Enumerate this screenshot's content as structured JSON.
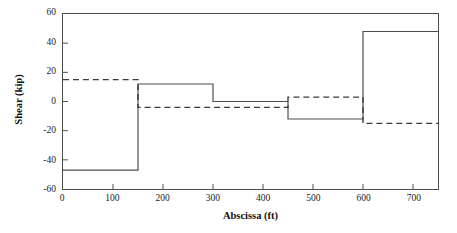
{
  "chart_data": {
    "type": "line",
    "title": "",
    "xlabel": "Abscissa (ft)",
    "ylabel": "Shear (kip)",
    "xlim": [
      0,
      750
    ],
    "ylim": [
      -60,
      60
    ],
    "xticks": [
      0,
      100,
      200,
      300,
      400,
      500,
      600,
      700
    ],
    "yticks": [
      -60,
      -40,
      -20,
      0,
      20,
      40,
      60
    ],
    "grid": false,
    "legend": "none",
    "series": [
      {
        "name": "solid-step",
        "style": "solid",
        "color": "#4d4d4d",
        "drawstyle": "steps-post",
        "x": [
          0,
          150,
          150,
          300,
          300,
          450,
          450,
          600,
          600,
          750
        ],
        "y": [
          -47,
          -47,
          12,
          12,
          0,
          0,
          -12,
          -12,
          48,
          48
        ],
        "segments": [
          {
            "x_start": 0,
            "x_end": 150,
            "value": -47
          },
          {
            "x_start": 150,
            "x_end": 300,
            "value": 12
          },
          {
            "x_start": 300,
            "x_end": 450,
            "value": 0
          },
          {
            "x_start": 450,
            "x_end": 600,
            "value": -12
          },
          {
            "x_start": 600,
            "x_end": 750,
            "value": 48
          }
        ]
      },
      {
        "name": "dashed-step",
        "style": "dashed",
        "color": "#3a3a3a",
        "drawstyle": "steps-post",
        "x": [
          0,
          150,
          150,
          450,
          450,
          600,
          600,
          750
        ],
        "y": [
          15,
          15,
          -4,
          -4,
          3,
          3,
          -15,
          -15
        ],
        "segments": [
          {
            "x_start": 0,
            "x_end": 150,
            "value": 15
          },
          {
            "x_start": 150,
            "x_end": 450,
            "value": -4
          },
          {
            "x_start": 450,
            "x_end": 600,
            "value": 3
          },
          {
            "x_start": 600,
            "x_end": 750,
            "value": -15
          }
        ]
      }
    ]
  },
  "axes": {
    "xtick_labels": [
      "0",
      "100",
      "200",
      "300",
      "400",
      "500",
      "600",
      "700"
    ],
    "ytick_labels": [
      "60",
      "40",
      "20",
      "0",
      "-20",
      "-40",
      "-60"
    ],
    "x_title": "Abscissa (ft)",
    "y_title": "Shear (kip)"
  },
  "colors": {
    "frame": "#4d4d4d",
    "solid_line": "#4d4d4d",
    "dashed_line": "#3a3a3a",
    "background": "#ffffff",
    "text": "#111111"
  }
}
